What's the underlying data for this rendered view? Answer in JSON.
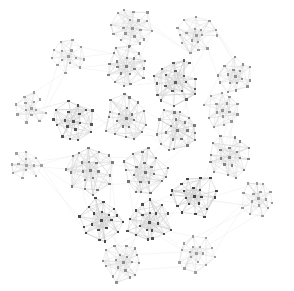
{
  "figure": {
    "title": "",
    "width": 294,
    "height": 291,
    "background_color": "#ffffff"
  },
  "chart_data": {
    "type": "scatter",
    "render_style": "node-link-graph",
    "title": "",
    "subtitle": "",
    "xlabel": "",
    "ylabel": "",
    "grid": false,
    "legend": null,
    "annotations": [],
    "xlim": [
      0,
      294
    ],
    "ylim": [
      0,
      291
    ],
    "axes_visible": false,
    "tick_labels": [],
    "layout": "circular-community-layout",
    "summary": {
      "cluster_count": 21,
      "nodes_per_cluster_range": [
        12,
        22
      ],
      "total_nodes_estimate": 430,
      "node_shape": "square",
      "node_color_dark": "#3a3a3a",
      "node_color_mid": "#8f8f8f",
      "node_color_light": "#c9c9c9",
      "edge_color_dark": "#cfcfcf",
      "edge_color_light": "#e8e8e8",
      "hub_and_spoke": true,
      "overall_envelope": "circle",
      "envelope_center": [
        147,
        145
      ],
      "envelope_radius": 140
    },
    "clusters": [
      {
        "id": "c01",
        "cx": 132,
        "cy": 28,
        "r": 20,
        "n": 18,
        "shade": 0.3,
        "seed": 11
      },
      {
        "id": "c02",
        "cx": 196,
        "cy": 35,
        "r": 19,
        "n": 17,
        "shade": 0.28,
        "seed": 23
      },
      {
        "id": "c03",
        "cx": 68,
        "cy": 56,
        "r": 16,
        "n": 14,
        "shade": 0.26,
        "seed": 37
      },
      {
        "id": "c04",
        "cx": 126,
        "cy": 66,
        "r": 21,
        "n": 19,
        "shade": 0.46,
        "seed": 41
      },
      {
        "id": "c05",
        "cx": 175,
        "cy": 82,
        "r": 22,
        "n": 20,
        "shade": 0.7,
        "seed": 53
      },
      {
        "id": "c06",
        "cx": 235,
        "cy": 76,
        "r": 18,
        "n": 16,
        "shade": 0.34,
        "seed": 67
      },
      {
        "id": "c07",
        "cx": 31,
        "cy": 108,
        "r": 16,
        "n": 13,
        "shade": 0.24,
        "seed": 71
      },
      {
        "id": "c08",
        "cx": 73,
        "cy": 121,
        "r": 20,
        "n": 18,
        "shade": 0.78,
        "seed": 83
      },
      {
        "id": "c09",
        "cx": 126,
        "cy": 118,
        "r": 22,
        "n": 20,
        "shade": 0.52,
        "seed": 97
      },
      {
        "id": "c10",
        "cx": 177,
        "cy": 130,
        "r": 22,
        "n": 20,
        "shade": 0.5,
        "seed": 101
      },
      {
        "id": "c11",
        "cx": 222,
        "cy": 110,
        "r": 17,
        "n": 15,
        "shade": 0.3,
        "seed": 113
      },
      {
        "id": "c12",
        "cx": 229,
        "cy": 157,
        "r": 21,
        "n": 19,
        "shade": 0.44,
        "seed": 127
      },
      {
        "id": "c13",
        "cx": 26,
        "cy": 165,
        "r": 15,
        "n": 12,
        "shade": 0.22,
        "seed": 131
      },
      {
        "id": "c14",
        "cx": 90,
        "cy": 170,
        "r": 23,
        "n": 21,
        "shade": 0.48,
        "seed": 139
      },
      {
        "id": "c15",
        "cx": 145,
        "cy": 172,
        "r": 22,
        "n": 20,
        "shade": 0.56,
        "seed": 149
      },
      {
        "id": "c16",
        "cx": 194,
        "cy": 196,
        "r": 22,
        "n": 20,
        "shade": 0.88,
        "seed": 151
      },
      {
        "id": "c17",
        "cx": 258,
        "cy": 198,
        "r": 17,
        "n": 15,
        "shade": 0.26,
        "seed": 163
      },
      {
        "id": "c18",
        "cx": 101,
        "cy": 220,
        "r": 21,
        "n": 19,
        "shade": 0.86,
        "seed": 173
      },
      {
        "id": "c19",
        "cx": 149,
        "cy": 222,
        "r": 21,
        "n": 19,
        "shade": 0.82,
        "seed": 181
      },
      {
        "id": "c20",
        "cx": 123,
        "cy": 262,
        "r": 20,
        "n": 18,
        "shade": 0.34,
        "seed": 191
      },
      {
        "id": "c21",
        "cx": 196,
        "cy": 253,
        "r": 18,
        "n": 16,
        "shade": 0.24,
        "seed": 197
      }
    ],
    "inter_cluster_links": [
      [
        "c01",
        "c04"
      ],
      [
        "c01",
        "c02"
      ],
      [
        "c02",
        "c06"
      ],
      [
        "c03",
        "c07"
      ],
      [
        "c04",
        "c05"
      ],
      [
        "c05",
        "c10"
      ],
      [
        "c06",
        "c11"
      ],
      [
        "c07",
        "c08"
      ],
      [
        "c08",
        "c09"
      ],
      [
        "c09",
        "c10"
      ],
      [
        "c10",
        "c15"
      ],
      [
        "c11",
        "c12"
      ],
      [
        "c12",
        "c16"
      ],
      [
        "c13",
        "c14"
      ],
      [
        "c14",
        "c15"
      ],
      [
        "c14",
        "c18"
      ],
      [
        "c15",
        "c19"
      ],
      [
        "c16",
        "c17"
      ],
      [
        "c16",
        "c19"
      ],
      [
        "c18",
        "c20"
      ],
      [
        "c19",
        "c20"
      ],
      [
        "c19",
        "c21"
      ],
      [
        "c21",
        "c17"
      ],
      [
        "c03",
        "c04"
      ],
      [
        "c13",
        "c18"
      ],
      [
        "c12",
        "c11"
      ],
      [
        "c20",
        "c21"
      ],
      [
        "c02",
        "c05"
      ]
    ]
  }
}
